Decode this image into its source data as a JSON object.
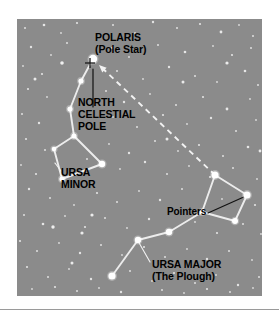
{
  "figure": {
    "background_color": "#ffffff",
    "sky_color": "#8b8b8b",
    "star_color": "#ffffff",
    "line_color": "#f2f2f2",
    "text_color": "#000000",
    "marker_color": "#1a1a1a"
  },
  "labels": {
    "polaris": "POLARIS\n(Pole Star)",
    "north_celestial_pole": "NORTH\nCELESTIAL\nPOLE",
    "ursa_minor": "URSA\nMINOR",
    "pointers": "Pointers",
    "ursa_major": "URSA MAJOR\n(The Plough)"
  },
  "chart_data": {
    "type": "scatter",
    "subtitle": "",
    "xlabel": "",
    "ylabel": "",
    "grid": false,
    "legend": "none",
    "xlim": [
      0,
      245
    ],
    "ylim": [
      0,
      277
    ],
    "annotations": [
      {
        "text": "POLARIS (Pole Star)",
        "x": 78,
        "y": 12,
        "points_to": [
          78,
          47
        ]
      },
      {
        "text": "NORTH CELESTIAL POLE",
        "x": 61,
        "y": 77,
        "points_to": [
          76,
          50
        ]
      },
      {
        "text": "URSA MINOR",
        "x": 44,
        "y": 147,
        "points_to": [
          40,
          143
        ]
      },
      {
        "text": "Pointers",
        "x": 150,
        "y": 187,
        "points_to": [
          230,
          176
        ]
      },
      {
        "text": "URSA MAJOR (The Plough)",
        "x": 135,
        "y": 239,
        "points_to": [
          120,
          253
        ]
      }
    ],
    "constellations": [
      {
        "name": "Ursa Minor",
        "stars": [
          {
            "label": "Polaris",
            "x": 76,
            "y": 40,
            "magnitude_size": 4.2
          },
          {
            "label": "Yildun",
            "x": 64,
            "y": 62,
            "magnitude_size": 2.6
          },
          {
            "label": "Epsilon UMi",
            "x": 53,
            "y": 90,
            "magnitude_size": 2.6
          },
          {
            "label": "Zeta UMi",
            "x": 57,
            "y": 117,
            "magnitude_size": 2.6
          },
          {
            "label": "Eta UMi",
            "x": 37,
            "y": 130,
            "magnitude_size": 2.3
          },
          {
            "label": "Gamma UMi",
            "x": 45,
            "y": 160,
            "magnitude_size": 2.6
          },
          {
            "label": "Beta UMi (Kochab)",
            "x": 85,
            "y": 145,
            "magnitude_size": 3.2
          }
        ],
        "lines": [
          [
            [
              76,
              40
            ],
            [
              64,
              62
            ]
          ],
          [
            [
              64,
              62
            ],
            [
              53,
              90
            ]
          ],
          [
            [
              53,
              90
            ],
            [
              57,
              117
            ]
          ],
          [
            [
              57,
              117
            ],
            [
              37,
              130
            ]
          ],
          [
            [
              37,
              130
            ],
            [
              45,
              160
            ]
          ],
          [
            [
              45,
              160
            ],
            [
              85,
              145
            ]
          ],
          [
            [
              85,
              145
            ],
            [
              57,
              117
            ]
          ]
        ]
      },
      {
        "name": "Ursa Major (The Plough)",
        "stars": [
          {
            "label": "Dubhe",
            "x": 198,
            "y": 156,
            "magnitude_size": 3.6
          },
          {
            "label": "Merak",
            "x": 230,
            "y": 176,
            "magnitude_size": 3.6
          },
          {
            "label": "Phecda",
            "x": 218,
            "y": 202,
            "magnitude_size": 3.0
          },
          {
            "label": "Megrez",
            "x": 185,
            "y": 193,
            "magnitude_size": 2.6
          },
          {
            "label": "Alioth",
            "x": 152,
            "y": 213,
            "magnitude_size": 3.2
          },
          {
            "label": "Mizar",
            "x": 121,
            "y": 221,
            "magnitude_size": 3.2
          },
          {
            "label": "Alkaid",
            "x": 95,
            "y": 257,
            "magnitude_size": 3.6
          }
        ],
        "lines": [
          [
            [
              198,
              156
            ],
            [
              230,
              176
            ]
          ],
          [
            [
              230,
              176
            ],
            [
              218,
              202
            ]
          ],
          [
            [
              218,
              202
            ],
            [
              185,
              193
            ]
          ],
          [
            [
              185,
              193
            ],
            [
              198,
              156
            ]
          ],
          [
            [
              185,
              193
            ],
            [
              152,
              213
            ]
          ],
          [
            [
              152,
              213
            ],
            [
              121,
              221
            ]
          ],
          [
            [
              121,
              221
            ],
            [
              95,
              257
            ]
          ]
        ]
      }
    ],
    "pointer_line": {
      "style": "dashed",
      "from": [
        198,
        156
      ],
      "to": [
        82,
        46
      ],
      "arrowhead_at": "to",
      "description": "Pointers line from the Plough bowl to Polaris"
    },
    "pole_marker": {
      "style": "cross",
      "x": 73,
      "y": 44,
      "description": "North celestial pole cross marker"
    },
    "pole_leader_line": {
      "from": [
        76,
        50
      ],
      "to": [
        76,
        88
      ],
      "style": "solid"
    },
    "background_stars": [
      [
        8,
        9,
        1.0
      ],
      [
        27,
        6,
        1.3
      ],
      [
        44,
        14,
        0.9
      ],
      [
        60,
        4,
        1.1
      ],
      [
        96,
        6,
        1.0
      ],
      [
        118,
        14,
        0.9
      ],
      [
        136,
        3,
        1.2
      ],
      [
        160,
        9,
        1.0
      ],
      [
        183,
        5,
        1.1
      ],
      [
        204,
        13,
        1.4
      ],
      [
        222,
        6,
        0.9
      ],
      [
        236,
        17,
        1.0
      ],
      [
        14,
        28,
        1.2
      ],
      [
        34,
        36,
        0.9
      ],
      [
        50,
        24,
        1.0
      ],
      [
        95,
        29,
        1.1
      ],
      [
        112,
        38,
        0.9
      ],
      [
        141,
        26,
        1.0
      ],
      [
        168,
        33,
        1.3
      ],
      [
        196,
        27,
        0.9
      ],
      [
        215,
        36,
        1.1
      ],
      [
        234,
        29,
        1.0
      ],
      [
        6,
        47,
        0.9
      ],
      [
        25,
        55,
        1.1
      ],
      [
        100,
        52,
        1.0
      ],
      [
        126,
        60,
        0.9
      ],
      [
        152,
        48,
        1.2
      ],
      [
        178,
        57,
        1.0
      ],
      [
        200,
        63,
        0.9
      ],
      [
        228,
        52,
        1.3
      ],
      [
        241,
        66,
        1.0
      ],
      [
        11,
        70,
        1.1
      ],
      [
        30,
        78,
        0.9
      ],
      [
        89,
        72,
        1.0
      ],
      [
        107,
        83,
        1.2
      ],
      [
        133,
        75,
        0.9
      ],
      [
        159,
        86,
        1.0
      ],
      [
        186,
        78,
        1.1
      ],
      [
        210,
        90,
        1.4
      ],
      [
        233,
        80,
        0.9
      ],
      [
        5,
        95,
        1.0
      ],
      [
        22,
        104,
        1.2
      ],
      [
        96,
        98,
        0.9
      ],
      [
        120,
        108,
        1.0
      ],
      [
        146,
        96,
        1.1
      ],
      [
        170,
        105,
        0.9
      ],
      [
        194,
        99,
        1.2
      ],
      [
        219,
        112,
        1.0
      ],
      [
        239,
        101,
        0.9
      ],
      [
        9,
        120,
        1.1
      ],
      [
        28,
        131,
        1.0
      ],
      [
        92,
        125,
        0.9
      ],
      [
        112,
        134,
        1.2
      ],
      [
        138,
        122,
        1.0
      ],
      [
        161,
        132,
        0.9
      ],
      [
        182,
        126,
        1.1
      ],
      [
        206,
        137,
        1.0
      ],
      [
        231,
        128,
        1.3
      ],
      [
        4,
        146,
        0.9
      ],
      [
        19,
        155,
        1.1
      ],
      [
        70,
        140,
        1.0
      ],
      [
        103,
        150,
        0.9
      ],
      [
        128,
        143,
        1.2
      ],
      [
        150,
        155,
        1.0
      ],
      [
        172,
        147,
        0.9
      ],
      [
        193,
        158,
        1.1
      ],
      [
        216,
        149,
        1.0
      ],
      [
        240,
        160,
        0.9
      ],
      [
        12,
        170,
        1.2
      ],
      [
        33,
        179,
        1.0
      ],
      [
        57,
        186,
        0.9
      ],
      [
        80,
        174,
        1.1
      ],
      [
        100,
        183,
        1.0
      ],
      [
        122,
        172,
        0.9
      ],
      [
        143,
        181,
        1.2
      ],
      [
        165,
        170,
        1.0
      ],
      [
        205,
        180,
        0.9
      ],
      [
        238,
        186,
        1.1
      ],
      [
        7,
        196,
        1.0
      ],
      [
        26,
        205,
        1.3
      ],
      [
        48,
        197,
        0.9
      ],
      [
        68,
        208,
        1.1
      ],
      [
        88,
        199,
        1.0
      ],
      [
        110,
        209,
        0.9
      ],
      [
        132,
        200,
        1.2
      ],
      [
        155,
        211,
        1.0
      ],
      [
        178,
        203,
        0.9
      ],
      [
        200,
        214,
        1.1
      ],
      [
        226,
        205,
        1.0
      ],
      [
        244,
        215,
        0.9
      ],
      [
        3,
        222,
        1.1
      ],
      [
        20,
        232,
        1.0
      ],
      [
        42,
        224,
        0.9
      ],
      [
        63,
        234,
        1.2
      ],
      [
        84,
        226,
        1.0
      ],
      [
        105,
        236,
        0.9
      ],
      [
        127,
        228,
        1.1
      ],
      [
        148,
        238,
        1.0
      ],
      [
        170,
        230,
        0.9
      ],
      [
        190,
        240,
        1.2
      ],
      [
        212,
        232,
        1.0
      ],
      [
        235,
        241,
        0.9
      ],
      [
        10,
        248,
        1.1
      ],
      [
        31,
        258,
        1.0
      ],
      [
        52,
        250,
        0.9
      ],
      [
        74,
        260,
        1.2
      ],
      [
        113,
        252,
        1.0
      ],
      [
        135,
        262,
        0.9
      ],
      [
        157,
        254,
        1.1
      ],
      [
        178,
        264,
        1.0
      ],
      [
        199,
        256,
        0.9
      ],
      [
        221,
        266,
        1.2
      ],
      [
        242,
        258,
        1.0
      ],
      [
        15,
        270,
        0.9
      ],
      [
        38,
        268,
        1.1
      ],
      [
        60,
        272,
        1.0
      ],
      [
        82,
        269,
        0.9
      ],
      [
        104,
        273,
        1.2
      ],
      [
        145,
        271,
        1.0
      ],
      [
        167,
        274,
        0.9
      ],
      [
        190,
        270,
        1.1
      ],
      [
        213,
        273,
        1.0
      ],
      [
        236,
        269,
        0.9
      ],
      [
        45,
        44,
        1.8
      ],
      [
        36,
        208,
        1.7
      ],
      [
        65,
        214,
        1.6
      ],
      [
        18,
        60,
        1.5
      ],
      [
        210,
        44,
        1.6
      ],
      [
        150,
        120,
        1.5
      ],
      [
        75,
        196,
        1.6
      ],
      [
        166,
        63,
        1.5
      ],
      [
        243,
        132,
        1.4
      ],
      [
        55,
        244,
        1.5
      ]
    ]
  }
}
